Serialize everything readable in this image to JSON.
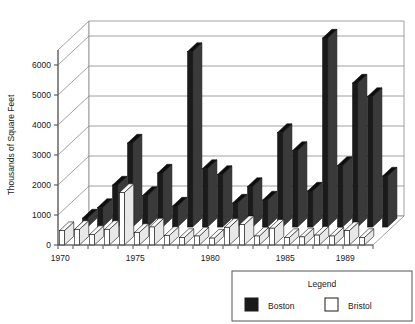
{
  "chart_data": {
    "type": "bar",
    "title": "",
    "subtitle": "",
    "xlabel": "",
    "ylabel": "Thousands of Square Feet",
    "ylim": [
      0,
      6500
    ],
    "yticks": [
      0,
      1000,
      2000,
      3000,
      4000,
      5000,
      6000
    ],
    "ytick_labels": [
      "0",
      "1000",
      "2000",
      "3000",
      "4000",
      "5000",
      "6000"
    ],
    "grid": true,
    "projection": "3d-grouped-columns",
    "legend_position": "bottom-right",
    "legend_title": "Legend",
    "categories": [
      1970,
      1971,
      1972,
      1973,
      1974,
      1975,
      1976,
      1977,
      1978,
      1979,
      1980,
      1981,
      1982,
      1983,
      1984,
      1985,
      1986,
      1987,
      1988,
      1989,
      1990
    ],
    "xtick_labels": [
      "1970",
      "1975",
      "1980",
      "1985",
      "1989"
    ],
    "xtick_values": [
      1970,
      1975,
      1980,
      1985,
      1989
    ],
    "series": [
      {
        "name": "Boston",
        "color": "#1a1a1a",
        "values": [
          300,
          650,
          1400,
          2800,
          1050,
          1800,
          700,
          5850,
          1950,
          1750,
          800,
          1350,
          900,
          3150,
          2550,
          1200,
          6300,
          2050,
          4800,
          4350,
          1700
        ]
      },
      {
        "name": "Bristol",
        "color": "#ffffff",
        "values": [
          480,
          520,
          350,
          520,
          1750,
          420,
          600,
          320,
          250,
          300,
          230,
          590,
          680,
          300,
          560,
          250,
          270,
          330,
          300,
          480,
          250
        ]
      }
    ]
  },
  "axes": {
    "y_axis_title": "Thousands of Square Feet"
  },
  "legend": {
    "title": "Legend",
    "entries": [
      {
        "label": "Boston",
        "swatch": "filled-dark"
      },
      {
        "label": "Bristol",
        "swatch": "outline-white"
      }
    ]
  },
  "colors": {
    "bar_front_boston": "#1a1a1a",
    "bar_side_boston": "#3a3a3a",
    "bar_top_boston": "#0d0d0d",
    "bar_front_bristol": "#ffffff",
    "bar_side_bristol": "#e8e8e8",
    "bar_top_bristol": "#f7f7f7",
    "grid": "#8a8a8a",
    "axis": "#555555",
    "text": "#1a1a1a",
    "background": "#ffffff"
  }
}
